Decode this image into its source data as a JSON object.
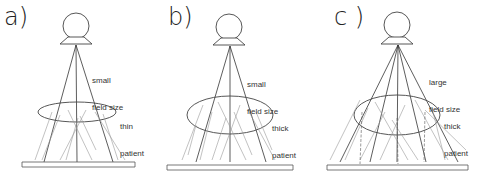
{
  "figure": {
    "panels": [
      {
        "id": "a",
        "label": "a)",
        "field_label_line1": "small",
        "field_label_line2": "field size",
        "patient_label_line1": "thin",
        "patient_label_line2": "patient",
        "field_size": "small",
        "patient_thickness": "thin"
      },
      {
        "id": "b",
        "label": "b)",
        "field_label_line1": "small",
        "field_label_line2": "field size",
        "patient_label_line1": "thick",
        "patient_label_line2": "patient",
        "field_size": "small",
        "patient_thickness": "thick"
      },
      {
        "id": "c",
        "label": "c )",
        "field_label_line1": "large",
        "field_label_line2": "field size",
        "patient_label_line1": "thick",
        "patient_label_line2": "patient",
        "field_size": "large",
        "patient_thickness": "thick"
      }
    ],
    "colors": {
      "primary_line": "#333333",
      "scatter_line": "#aaaaaa",
      "background": "#ffffff"
    }
  }
}
